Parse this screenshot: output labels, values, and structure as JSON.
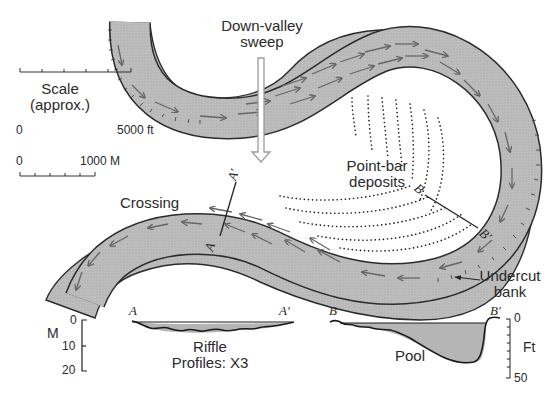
{
  "diagram": {
    "title_labels": {
      "down_valley_line1": "Down-valley",
      "down_valley_line2": "sweep",
      "point_bar_line1": "Point-bar",
      "point_bar_line2": "deposits",
      "crossing": "Crossing",
      "undercut_line1": "Undercut",
      "undercut_line2": "bank"
    },
    "scale": {
      "title_line1": "Scale",
      "title_line2": "(approx.)",
      "feet_start": "0",
      "feet_end": "5000 ft",
      "meters_start": "0",
      "meters_end": "1000 M"
    },
    "sections": {
      "a": "A",
      "a_prime": "A′",
      "b": "B",
      "b_prime": "B′"
    },
    "profiles": {
      "riffle_line1": "Riffle",
      "riffle_line2": "Profiles: X3",
      "pool": "Pool",
      "left_axis": {
        "unit": "M",
        "ticks": [
          "0",
          "10",
          "20"
        ]
      },
      "right_axis": {
        "unit": "Ft",
        "ticks": [
          "0",
          "50"
        ]
      }
    },
    "colors": {
      "channel_fill": "#b9b9b9",
      "channel_edge": "#2a2a2a",
      "arrow": "#6a6a6a",
      "deposit_dots": "#1a1a1a",
      "sweep_arrow": "#9a9a9a"
    }
  }
}
